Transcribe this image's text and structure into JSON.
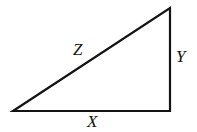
{
  "figure": {
    "kind": "geometry-diagram",
    "shape_name": "right-triangle",
    "width": 197,
    "height": 132,
    "background_color": "#ffffff",
    "stroke_color": "#141414",
    "stroke_width": 2.2,
    "label_color": "#141414"
  },
  "labels": {
    "hypotenuse": "Z",
    "vertical_leg": "Y",
    "horizontal_leg": "X"
  },
  "geometry": {
    "vertices": {
      "left": [
        13,
        111
      ],
      "right_angle": [
        170,
        111
      ],
      "apex": [
        170,
        8
      ]
    },
    "sides": [
      {
        "name": "horizontal-leg",
        "label": "X",
        "from": [
          13,
          111
        ],
        "to": [
          170,
          111
        ]
      },
      {
        "name": "vertical-leg",
        "label": "Y",
        "from": [
          170,
          111
        ],
        "to": [
          170,
          8
        ]
      },
      {
        "name": "hypotenuse",
        "label": "Z",
        "from": [
          13,
          111
        ],
        "to": [
          170,
          8
        ]
      }
    ],
    "label_positions": {
      "Z": [
        82,
        52
      ],
      "Y": [
        181,
        58
      ],
      "X": [
        95,
        123
      ]
    }
  }
}
